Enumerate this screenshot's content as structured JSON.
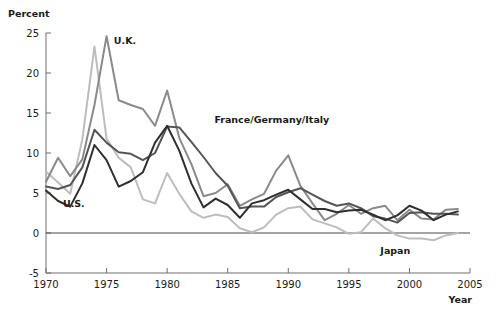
{
  "chart_data": {
    "type": "line",
    "title": "",
    "xlabel": "Year",
    "ylabel": "Percent",
    "xlim": [
      1970,
      2005
    ],
    "ylim": [
      -5,
      25
    ],
    "grid": false,
    "legend_position": "inline-annotations",
    "xticks": [
      "1970",
      "1975",
      "1980",
      "1985",
      "1990",
      "1995",
      "2000",
      "2005"
    ],
    "xtick_values": [
      1970,
      1975,
      1980,
      1985,
      1990,
      1995,
      2000,
      2005
    ],
    "yticks": [
      "25",
      "20",
      "15",
      "10",
      "5",
      "0",
      "-5"
    ],
    "ytick_values": [
      25,
      20,
      15,
      10,
      5,
      0,
      -5
    ],
    "x": [
      1970,
      1971,
      1972,
      1973,
      1974,
      1975,
      1976,
      1977,
      1978,
      1979,
      1980,
      1981,
      1982,
      1983,
      1984,
      1985,
      1986,
      1987,
      1988,
      1989,
      1990,
      1991,
      1992,
      1993,
      1994,
      1995,
      1996,
      1997,
      1998,
      1999,
      2000,
      2001,
      2002,
      2003,
      2004
    ],
    "series": [
      {
        "name": "U.S.",
        "color": "#2f2f2f",
        "width": 2.0,
        "values": [
          5.3,
          4.0,
          3.3,
          6.2,
          11.0,
          9.1,
          5.8,
          6.5,
          7.6,
          11.3,
          13.4,
          10.3,
          6.2,
          3.2,
          4.3,
          3.5,
          1.9,
          3.7,
          4.1,
          4.8,
          5.4,
          4.2,
          3.0,
          3.0,
          2.6,
          2.8,
          2.9,
          2.3,
          1.6,
          2.2,
          3.4,
          2.8,
          1.6,
          2.3,
          2.7
        ]
      },
      {
        "name": "France/Germany/Italy",
        "color": "#555555",
        "width": 2.0,
        "values": [
          5.8,
          5.5,
          6.0,
          8.2,
          12.9,
          11.3,
          10.1,
          9.9,
          9.1,
          10.0,
          13.3,
          13.2,
          11.4,
          9.5,
          7.5,
          5.9,
          3.1,
          3.3,
          3.3,
          4.5,
          5.1,
          5.6,
          4.8,
          4.0,
          3.4,
          3.7,
          3.1,
          2.1,
          1.8,
          1.3,
          2.5,
          2.6,
          2.4,
          2.4,
          2.3
        ]
      },
      {
        "name": "U.K.",
        "color": "#8a8a8a",
        "width": 2.0,
        "values": [
          6.4,
          9.4,
          7.1,
          9.2,
          16.0,
          24.6,
          16.6,
          16.0,
          15.5,
          13.4,
          17.8,
          11.9,
          8.6,
          4.6,
          5.0,
          6.1,
          3.4,
          4.2,
          4.9,
          7.8,
          9.7,
          5.9,
          3.7,
          1.6,
          2.4,
          3.5,
          2.4,
          3.1,
          3.4,
          1.6,
          2.9,
          1.8,
          1.7,
          2.9,
          3.0
        ]
      },
      {
        "name": "Japan",
        "color": "#bdbdbd",
        "width": 2.0,
        "values": [
          7.7,
          6.3,
          4.9,
          11.7,
          23.3,
          11.8,
          9.4,
          8.2,
          4.2,
          3.7,
          7.5,
          4.9,
          2.7,
          1.9,
          2.3,
          2.0,
          0.6,
          0.1,
          0.7,
          2.3,
          3.1,
          3.3,
          1.7,
          1.2,
          0.7,
          -0.1,
          0.1,
          1.8,
          0.6,
          -0.3,
          -0.7,
          -0.7,
          -0.9,
          -0.3,
          0.0
        ]
      }
    ],
    "annotations": [
      {
        "text": "U.K.",
        "x": 1975.6,
        "y": 23.6,
        "anchor": "start"
      },
      {
        "text": "U.S.",
        "x": 1971.4,
        "y": 3.2,
        "anchor": "start"
      },
      {
        "text": "France/Germany/Italy",
        "x": 1983.9,
        "y": 13.7,
        "anchor": "start"
      },
      {
        "text": "Japan",
        "x": 1997.6,
        "y": -2.6,
        "anchor": "start"
      }
    ]
  }
}
